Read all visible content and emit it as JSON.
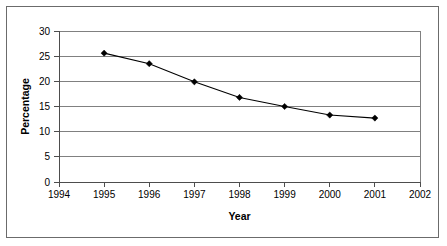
{
  "chart_data": {
    "type": "line",
    "title": "",
    "xlabel": "Year",
    "ylabel": "Percentage",
    "x": [
      1995,
      1996,
      1997,
      1998,
      1999,
      2000,
      2001
    ],
    "values": [
      25.6,
      23.5,
      19.9,
      16.8,
      15.0,
      13.3,
      12.7
    ],
    "series": [
      {
        "name": "Percentage",
        "values": [
          25.6,
          23.5,
          19.9,
          16.8,
          15.0,
          13.3,
          12.7
        ]
      }
    ],
    "xtick_labels": [
      "1994",
      "1995",
      "1996",
      "1997",
      "1998",
      "1999",
      "2000",
      "2001",
      "2002"
    ],
    "ytick_labels": [
      "0",
      "5",
      "10",
      "15",
      "20",
      "25",
      "30"
    ],
    "xlim": [
      1994,
      2002
    ],
    "ylim": [
      0,
      30
    ],
    "grid": "horizontal",
    "legend": "none",
    "marker": "diamond",
    "line_color": "#000000",
    "marker_color": "#000000",
    "grid_color": "#808080",
    "axis_color": "#4d4d4d",
    "background": "#ffffff"
  }
}
